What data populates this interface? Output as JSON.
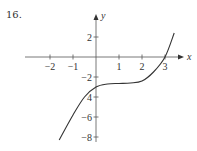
{
  "problem_number": "16.",
  "chart_data": {
    "type": "line",
    "title": "",
    "xlabel": "x",
    "ylabel": "y",
    "xlim": [
      -2.7,
      3.6
    ],
    "ylim": [
      -8.5,
      4.2
    ],
    "grid": false,
    "legend": null,
    "x_ticks": [
      -2,
      -1,
      1,
      2,
      3
    ],
    "x_tick_labels": [
      "−2",
      "−1",
      "1",
      "2",
      "3"
    ],
    "y_ticks": [
      2,
      -2,
      -4,
      -6,
      -8
    ],
    "y_tick_labels": [
      "2",
      "−2",
      "4",
      "−6",
      "−8"
    ],
    "series": [
      {
        "name": "f(x)",
        "x": [
          -1.6,
          -1.0,
          -0.5,
          0.0,
          0.5,
          1.0,
          1.5,
          2.0,
          2.5,
          3.0,
          3.4
        ],
        "y": [
          -8.3,
          -5.8,
          -4.0,
          -3.0,
          -2.7,
          -2.65,
          -2.6,
          -2.4,
          -1.5,
          0.0,
          2.4
        ]
      }
    ]
  },
  "layout": {
    "origin_px": [
      96,
      57
    ],
    "px_per_x": 23,
    "px_per_y": 10,
    "axis_color": "#555555",
    "curve_color": "#333333"
  }
}
